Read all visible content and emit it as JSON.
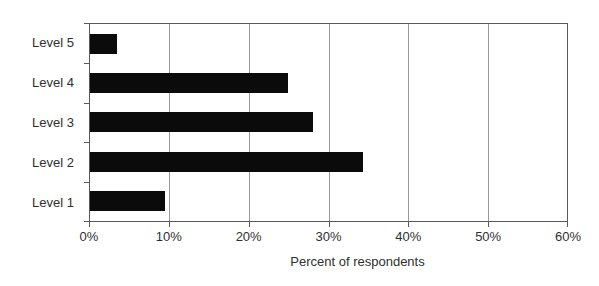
{
  "chart_data": {
    "type": "bar",
    "orientation": "horizontal",
    "title": "",
    "xlabel": "Percent of respondents",
    "ylabel": "",
    "categories_top_to_bottom": [
      "Level 5",
      "Level 4",
      "Level 3",
      "Level 2",
      "Level 1"
    ],
    "values_percent": [
      3.4,
      24.9,
      28.0,
      34.3,
      9.4
    ],
    "xlim": [
      0,
      60
    ],
    "x_tick_labels": [
      "0%",
      "10%",
      "20%",
      "30%",
      "40%",
      "50%",
      "60%"
    ],
    "grid": "vertical-gridlines-on",
    "legend": "none",
    "bar_color": "#0b0b0b",
    "gridline_color": "#9a9a9a",
    "axis_color": "#5a5a5a",
    "text_color": "#2f2f2f"
  }
}
